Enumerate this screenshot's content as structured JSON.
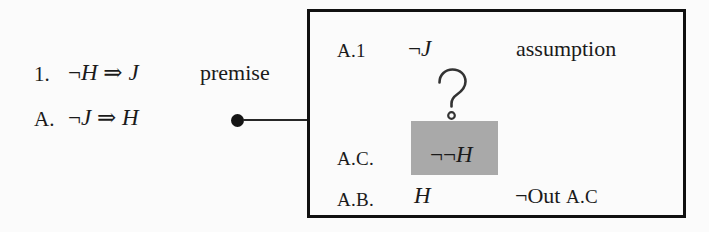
{
  "figure": {
    "background_color": "#fbfbfb",
    "ink_color": "#1a1a1a"
  },
  "proof": {
    "lines": [
      {
        "label": "1.",
        "formula_prefix": "¬",
        "formula_antecedent": "H",
        "formula_connective": "⇒",
        "formula_consequent": "J",
        "formula": "¬H ⇒ J",
        "justification": "premise"
      },
      {
        "label": "A.",
        "formula_prefix": "¬",
        "formula_antecedent": "J",
        "formula_connective": "⇒",
        "formula_consequent": "H",
        "formula": "¬J ⇒ H",
        "justification": ""
      }
    ]
  },
  "connector": {
    "dot_name": "connector-dot",
    "line_name": "connector-line",
    "color": "#151515"
  },
  "callout": {
    "border_color": "#111111",
    "rows": [
      {
        "label": "A.1",
        "formula_prefix": "¬",
        "formula_var": "J",
        "formula": "¬J",
        "justification": "assumption",
        "justification_ref": ""
      },
      {
        "label": "A.C.",
        "formula_prefix": "¬¬",
        "formula_var": "H",
        "formula": "¬¬H",
        "justification": "",
        "justification_ref": "",
        "highlighted": true,
        "highlight_color": "#a9a9a9"
      },
      {
        "label": "A.B.",
        "formula_prefix": "",
        "formula_var": "H",
        "formula": "H",
        "justification": "¬Out",
        "justification_ref": "A.C"
      }
    ],
    "question_mark": {
      "glyph": "?",
      "style": "outline"
    }
  }
}
